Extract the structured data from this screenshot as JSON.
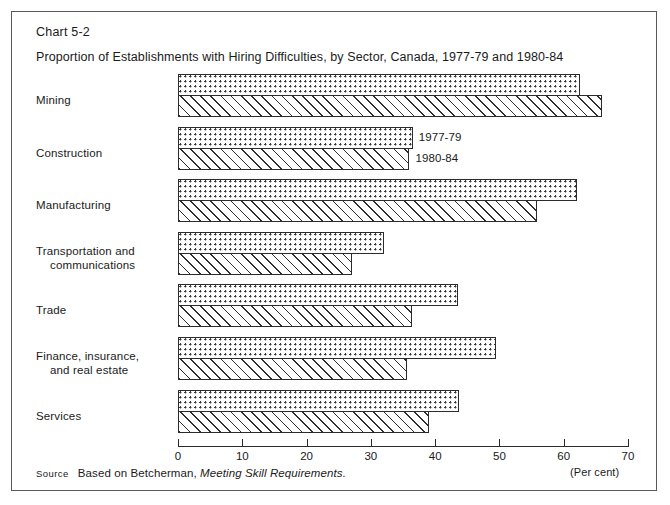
{
  "chart_number": "Chart 5-2",
  "source": {
    "label": "Source",
    "text": "Based on Betcherman,",
    "reference": "Meeting Skill Requirements."
  },
  "chart_data": {
    "type": "bar",
    "orientation": "horizontal",
    "title": "Proportion of Establishments with Hiring Difficulties, by Sector, Canada, 1977-79 and 1980-84",
    "xlabel": "(Per cent)",
    "ylabel": "",
    "xlim": [
      0,
      70
    ],
    "xticks": [
      0,
      10,
      20,
      30,
      40,
      50,
      60,
      70
    ],
    "xtick_labels": [
      "0",
      "10",
      "20",
      "30",
      "40",
      "50",
      "60",
      "70"
    ],
    "grid": false,
    "legend_position": "inline-construction-row",
    "categories": [
      "Mining",
      "Construction",
      "Manufacturing",
      "Transportation and communications",
      "Trade",
      "Finance, insurance, and real estate",
      "Services"
    ],
    "category_lines": [
      [
        "Mining"
      ],
      [
        "Construction"
      ],
      [
        "Manufacturing"
      ],
      [
        "Transportation and",
        "communications"
      ],
      [
        "Trade"
      ],
      [
        "Finance, insurance,",
        "and real estate"
      ],
      [
        "Services"
      ]
    ],
    "series": [
      {
        "name": "1977-79",
        "pattern": "dots",
        "values": [
          62.5,
          36.5,
          62.0,
          32.0,
          43.5,
          49.5,
          43.7
        ]
      },
      {
        "name": "1980-84",
        "pattern": "hatch",
        "values": [
          66.0,
          36.0,
          55.8,
          27.0,
          36.4,
          35.6,
          39.0
        ]
      }
    ]
  }
}
